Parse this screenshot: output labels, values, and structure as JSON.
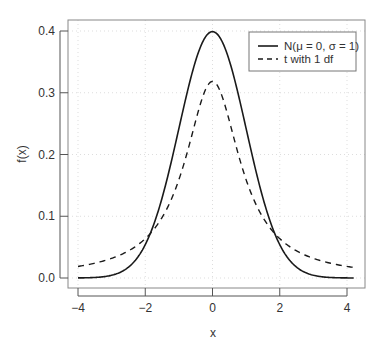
{
  "chart_data": {
    "type": "line",
    "title": "",
    "xlabel": "x",
    "ylabel": "f(x)",
    "xlim": [
      -4.25,
      4.55
    ],
    "ylim": [
      -0.016,
      0.415
    ],
    "xticks": [
      -4,
      -2,
      0,
      2,
      4
    ],
    "xtick_labels": [
      "−4",
      "−2",
      "0",
      "2",
      "4"
    ],
    "yticks": [
      0.0,
      0.1,
      0.2,
      0.3,
      0.4
    ],
    "ytick_labels": [
      "0.0",
      "0.1",
      "0.2",
      "0.3",
      "0.4"
    ],
    "grid": true,
    "legend_position": "top-right",
    "x_range": [
      -4,
      4.2
    ],
    "series": [
      {
        "name": "N(μ = 0, σ = 1)",
        "style": "solid",
        "color": "#1a1a1a",
        "distribution": "normal",
        "x": [
          -4,
          -3,
          -2,
          -1.5,
          -1,
          -0.5,
          0,
          0.5,
          1,
          1.5,
          2,
          3,
          4
        ],
        "values": [
          0.0001,
          0.0044,
          0.054,
          0.1295,
          0.242,
          0.3521,
          0.3989,
          0.3521,
          0.242,
          0.1295,
          0.054,
          0.0044,
          0.0001
        ]
      },
      {
        "name": "t with 1 df",
        "style": "dashed",
        "color": "#1a1a1a",
        "distribution": "t1",
        "x": [
          -4,
          -3,
          -2,
          -1.5,
          -1,
          -0.5,
          0,
          0.5,
          1,
          1.5,
          2,
          3,
          4
        ],
        "values": [
          0.0187,
          0.0318,
          0.0637,
          0.0979,
          0.1592,
          0.2546,
          0.3183,
          0.2546,
          0.1592,
          0.0979,
          0.0637,
          0.0318,
          0.0187
        ]
      }
    ]
  },
  "legend": {
    "items": [
      {
        "label": "N(μ = 0, σ = 1)",
        "style": "solid"
      },
      {
        "label": "t with 1 df",
        "style": "dashed"
      }
    ]
  },
  "colors": {
    "line": "#1a1a1a",
    "axis": "#555555",
    "box": "#888888",
    "grid": "#dddddd",
    "text": "#333333"
  }
}
